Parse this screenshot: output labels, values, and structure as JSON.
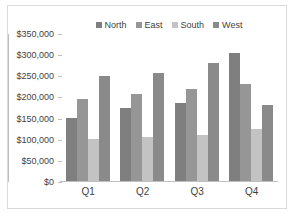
{
  "chart_data": {
    "type": "bar",
    "title": "",
    "subtitle": "",
    "xlabel": "",
    "ylabel": "",
    "categories": [
      "Q1",
      "Q2",
      "Q3",
      "Q4"
    ],
    "series": [
      {
        "name": "North",
        "color": "#7f7f7f",
        "values": [
          148000,
          172000,
          185000,
          303000
        ]
      },
      {
        "name": "East",
        "color": "#969696",
        "values": [
          194000,
          205000,
          218000,
          229000
        ]
      },
      {
        "name": "South",
        "color": "#c3c3c3",
        "values": [
          100000,
          103000,
          109000,
          124000
        ]
      },
      {
        "name": "West",
        "color": "#8a8a8a",
        "values": [
          249000,
          256000,
          280000,
          180000
        ]
      }
    ],
    "ylim": [
      0,
      350000
    ],
    "ytick_values": [
      0,
      50000,
      100000,
      150000,
      200000,
      250000,
      300000,
      350000
    ],
    "ytick_labels": [
      "$0",
      "$50,000",
      "$100,000",
      "$150,000",
      "$200,000",
      "$250,000",
      "$300,000",
      "$350,000"
    ],
    "grid": false,
    "legend_position": "top-center",
    "legend_entries": [
      "North",
      "East",
      "South",
      "West"
    ],
    "annotations": []
  },
  "colors": {
    "border": "#d9d9d9",
    "axis": "#bfbfbf",
    "text": "#3f3f3f",
    "background": "#ffffff"
  }
}
